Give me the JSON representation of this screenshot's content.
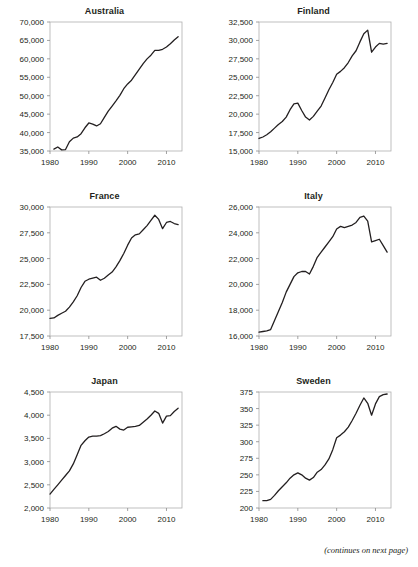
{
  "page": {
    "footnote": "(continues on next page)",
    "line_color": "#231f20",
    "frame_color": "#b0b0b0"
  },
  "chart_data": [
    {
      "type": "line",
      "title": "Australia",
      "xlabel": "",
      "ylabel": "",
      "xlim": [
        1980,
        2014
      ],
      "ylim": [
        35000,
        70000
      ],
      "xticks": [
        1980,
        1990,
        2000,
        2010
      ],
      "yticks": [
        35000,
        40000,
        45000,
        50000,
        55000,
        60000,
        65000,
        70000
      ],
      "ytick_labels": [
        "35,000",
        "40,000",
        "45,000",
        "50,000",
        "55,000",
        "60,000",
        "65,000",
        "70,000"
      ],
      "xtick_labels": [
        "1980",
        "1990",
        "2000",
        "2010"
      ],
      "grid": false,
      "legend": "none",
      "x": [
        1981,
        1982,
        1983,
        1984,
        1985,
        1986,
        1987,
        1988,
        1989,
        1990,
        1991,
        1992,
        1993,
        1994,
        1995,
        1996,
        1997,
        1998,
        1999,
        2000,
        2001,
        2002,
        2003,
        2004,
        2005,
        2006,
        2007,
        2008,
        2009,
        2010,
        2011,
        2012,
        2013
      ],
      "values": [
        35500,
        36100,
        35300,
        35400,
        37500,
        38500,
        38800,
        39700,
        41300,
        42600,
        42300,
        41800,
        42400,
        44100,
        45800,
        47200,
        48600,
        50100,
        51900,
        53200,
        54200,
        55700,
        57200,
        58700,
        60000,
        61000,
        62300,
        62300,
        62600,
        63200,
        64100,
        65100,
        66000
      ]
    },
    {
      "type": "line",
      "title": "Finland",
      "xlabel": "",
      "ylabel": "",
      "xlim": [
        1980,
        2014
      ],
      "ylim": [
        15000,
        32500
      ],
      "xticks": [
        1980,
        1990,
        2000,
        2010
      ],
      "yticks": [
        15000,
        17500,
        20000,
        22500,
        25000,
        27500,
        30000,
        32500
      ],
      "ytick_labels": [
        "15,000",
        "17,500",
        "20,000",
        "22,500",
        "25,000",
        "27,500",
        "30,000",
        "32,500"
      ],
      "xtick_labels": [
        "1980",
        "1990",
        "2000",
        "2010"
      ],
      "grid": false,
      "legend": "none",
      "x": [
        1980,
        1981,
        1982,
        1983,
        1984,
        1985,
        1986,
        1987,
        1988,
        1989,
        1990,
        1991,
        1992,
        1993,
        1994,
        1995,
        1996,
        1997,
        1998,
        1999,
        2000,
        2001,
        2002,
        2003,
        2004,
        2005,
        2006,
        2007,
        2008,
        2009,
        2010,
        2011,
        2012,
        2013
      ],
      "values": [
        16700,
        16900,
        17200,
        17600,
        18100,
        18600,
        19000,
        19600,
        20600,
        21400,
        21500,
        20500,
        19600,
        19200,
        19700,
        20400,
        21100,
        22200,
        23300,
        24300,
        25400,
        25800,
        26300,
        27000,
        27900,
        28600,
        29800,
        30900,
        31400,
        28400,
        29100,
        29600,
        29500,
        29600
      ]
    },
    {
      "type": "line",
      "title": "France",
      "xlabel": "",
      "ylabel": "",
      "xlim": [
        1980,
        2014
      ],
      "ylim": [
        17500,
        30000
      ],
      "xticks": [
        1980,
        1990,
        2000,
        2010
      ],
      "yticks": [
        17500,
        20000,
        22500,
        25000,
        27500,
        30000
      ],
      "ytick_labels": [
        "17,500",
        "20,000",
        "22,500",
        "25,000",
        "27,500",
        "30,000"
      ],
      "xtick_labels": [
        "1980",
        "1990",
        "2000",
        "2010"
      ],
      "grid": false,
      "legend": "none",
      "x": [
        1980,
        1981,
        1982,
        1983,
        1984,
        1985,
        1986,
        1987,
        1988,
        1989,
        1990,
        1991,
        1992,
        1993,
        1994,
        1995,
        1996,
        1997,
        1998,
        1999,
        2000,
        2001,
        2002,
        2003,
        2004,
        2005,
        2006,
        2007,
        2008,
        2009,
        2010,
        2011,
        2012,
        2013
      ],
      "values": [
        19200,
        19250,
        19500,
        19700,
        19900,
        20300,
        20800,
        21400,
        22200,
        22800,
        23000,
        23100,
        23200,
        22900,
        23100,
        23400,
        23700,
        24200,
        24800,
        25500,
        26300,
        27000,
        27300,
        27400,
        27800,
        28200,
        28700,
        29200,
        28800,
        27900,
        28500,
        28600,
        28400,
        28300
      ]
    },
    {
      "type": "line",
      "title": "Italy",
      "xlabel": "",
      "ylabel": "",
      "xlim": [
        1980,
        2014
      ],
      "ylim": [
        16000,
        26000
      ],
      "xticks": [
        1980,
        1990,
        2000,
        2010
      ],
      "yticks": [
        16000,
        18000,
        20000,
        22000,
        24000,
        26000
      ],
      "ytick_labels": [
        "16,000",
        "18,000",
        "20,000",
        "22,000",
        "24,000",
        "26,000"
      ],
      "xtick_labels": [
        "1980",
        "1990",
        "2000",
        "2010"
      ],
      "grid": false,
      "legend": "none",
      "x": [
        1980,
        1981,
        1982,
        1983,
        1984,
        1985,
        1986,
        1987,
        1988,
        1989,
        1990,
        1991,
        1992,
        1993,
        1994,
        1995,
        1996,
        1997,
        1998,
        1999,
        2000,
        2001,
        2002,
        2003,
        2004,
        2005,
        2006,
        2007,
        2008,
        2009,
        2010,
        2011,
        2012,
        2013
      ],
      "values": [
        16300,
        16350,
        16400,
        16500,
        17200,
        17900,
        18600,
        19400,
        20000,
        20600,
        20900,
        21000,
        21000,
        20800,
        21400,
        22100,
        22500,
        22900,
        23300,
        23700,
        24300,
        24500,
        24400,
        24500,
        24600,
        24800,
        25200,
        25300,
        24900,
        23300,
        23400,
        23500,
        23000,
        22500
      ]
    },
    {
      "type": "line",
      "title": "Japan",
      "xlabel": "",
      "ylabel": "",
      "xlim": [
        1980,
        2014
      ],
      "ylim": [
        2000,
        4500
      ],
      "xticks": [
        1980,
        1990,
        2000,
        2010
      ],
      "yticks": [
        2000,
        2500,
        3000,
        3500,
        4000,
        4500
      ],
      "ytick_labels": [
        "2,000",
        "2,500",
        "3,000",
        "3,500",
        "4,000",
        "4,500"
      ],
      "xtick_labels": [
        "1980",
        "1990",
        "2000",
        "2010"
      ],
      "grid": false,
      "legend": "none",
      "x": [
        1980,
        1981,
        1982,
        1983,
        1984,
        1985,
        1986,
        1987,
        1988,
        1989,
        1990,
        1991,
        1992,
        1993,
        1994,
        1995,
        1996,
        1997,
        1998,
        1999,
        2000,
        2001,
        2002,
        2003,
        2004,
        2005,
        2006,
        2007,
        2008,
        2009,
        2010,
        2011,
        2012,
        2013
      ],
      "values": [
        2300,
        2400,
        2500,
        2600,
        2700,
        2800,
        2950,
        3150,
        3350,
        3450,
        3530,
        3550,
        3550,
        3560,
        3600,
        3650,
        3720,
        3760,
        3700,
        3680,
        3740,
        3750,
        3760,
        3780,
        3850,
        3920,
        4000,
        4090,
        4040,
        3830,
        3980,
        3990,
        4080,
        4150
      ]
    },
    {
      "type": "line",
      "title": "Sweden",
      "xlabel": "",
      "ylabel": "",
      "xlim": [
        1980,
        2014
      ],
      "ylim": [
        200,
        375
      ],
      "xticks": [
        1980,
        1990,
        2000,
        2010
      ],
      "yticks": [
        200,
        225,
        250,
        275,
        300,
        325,
        350,
        375
      ],
      "ytick_labels": [
        "200",
        "225",
        "250",
        "275",
        "300",
        "325",
        "350",
        "375"
      ],
      "xtick_labels": [
        "1980",
        "1990",
        "2000",
        "2010"
      ],
      "grid": false,
      "legend": "none",
      "x": [
        1981,
        1982,
        1983,
        1984,
        1985,
        1986,
        1987,
        1988,
        1989,
        1990,
        1991,
        1992,
        1993,
        1994,
        1995,
        1996,
        1997,
        1998,
        1999,
        2000,
        2001,
        2002,
        2003,
        2004,
        2005,
        2006,
        2007,
        2008,
        2009,
        2010,
        2011,
        2012,
        2013
      ],
      "values": [
        211,
        211,
        213,
        219,
        226,
        232,
        238,
        245,
        250,
        253,
        250,
        245,
        242,
        246,
        254,
        258,
        265,
        274,
        288,
        306,
        310,
        315,
        322,
        332,
        343,
        355,
        366,
        358,
        340,
        357,
        368,
        371,
        372
      ]
    }
  ]
}
